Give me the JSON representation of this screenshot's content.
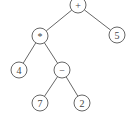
{
  "diagram": {
    "type": "expression-tree",
    "colors": {
      "stroke": "#555555",
      "text": "#444444",
      "background": "#ffffff"
    },
    "radius": 8,
    "nodes": [
      {
        "id": "plus",
        "label": "+",
        "x": 78,
        "y": 5
      },
      {
        "id": "times",
        "label": "*",
        "x": 40,
        "y": 36
      },
      {
        "id": "five",
        "label": "5",
        "x": 117,
        "y": 35
      },
      {
        "id": "four",
        "label": "4",
        "x": 19,
        "y": 70
      },
      {
        "id": "minus",
        "label": "−",
        "x": 62,
        "y": 70
      },
      {
        "id": "seven",
        "label": "7",
        "x": 40,
        "y": 103
      },
      {
        "id": "two",
        "label": "2",
        "x": 82,
        "y": 103
      }
    ],
    "edges": [
      {
        "from": "plus",
        "to": "times"
      },
      {
        "from": "plus",
        "to": "five"
      },
      {
        "from": "times",
        "to": "four"
      },
      {
        "from": "times",
        "to": "minus"
      },
      {
        "from": "minus",
        "to": "seven"
      },
      {
        "from": "minus",
        "to": "two"
      }
    ]
  }
}
